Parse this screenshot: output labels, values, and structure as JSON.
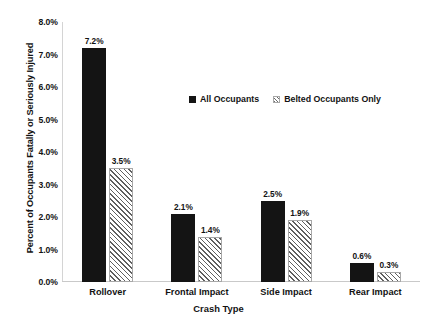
{
  "chart_data": {
    "type": "bar",
    "title": "",
    "xlabel": "Crash Type",
    "ylabel": "Percent of Occupants Fatally or Seriously Injured",
    "categories": [
      "Rollover",
      "Frontal Impact",
      "Side Impact",
      "Rear Impact"
    ],
    "series": [
      {
        "name": "All Occupants",
        "values": [
          7.2,
          2.1,
          2.5,
          0.6
        ],
        "labels": [
          "7.2%",
          "2.1%",
          "2.5%",
          "0.6%"
        ],
        "style": "solid",
        "color": "#141414"
      },
      {
        "name": "Belted Occupants Only",
        "values": [
          3.5,
          1.4,
          1.9,
          0.3
        ],
        "labels": [
          "3.5%",
          "1.4%",
          "1.9%",
          "0.3%"
        ],
        "style": "hatched",
        "color": "#ffffff"
      }
    ],
    "ylim": [
      0,
      8
    ],
    "ytick_values": [
      0,
      1,
      2,
      3,
      4,
      5,
      6,
      7,
      8
    ],
    "ytick_labels": [
      "0.0%",
      "1.0%",
      "2.0%",
      "3.0%",
      "4.0%",
      "5.0%",
      "6.0%",
      "7.0%",
      "8.0%"
    ],
    "grid": false,
    "legend_position": "inside-upper-center",
    "units": "percent",
    "background_color": "#ffffff",
    "axis_color": "#c9c9c9"
  },
  "legend": {
    "entries": [
      {
        "label": "All Occupants",
        "swatch": "solid-square-icon"
      },
      {
        "label": "Belted Occupants Only",
        "swatch": "hatched-square-icon"
      }
    ]
  }
}
